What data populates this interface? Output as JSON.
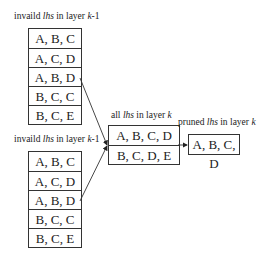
{
  "top_group": {
    "label_pre": "invaild ",
    "label_em": "lhs",
    "label_mid": " in layer ",
    "label_k": "k",
    "label_post": "-1",
    "rows": [
      "A, B, C",
      "A, C, D",
      "A, B, D",
      "B, C, C",
      "B, C, E"
    ]
  },
  "bottom_group": {
    "label_pre": "invaild ",
    "label_em": "lhs",
    "label_mid": " in layer ",
    "label_k": "k",
    "label_post": "-1",
    "rows": [
      "A, B, C",
      "A, C, D",
      "A, B, D",
      "B, C, C",
      "B, C, E"
    ]
  },
  "middle_group": {
    "label_pre": "all ",
    "label_em": "lhs",
    "label_mid": " in layer ",
    "label_k": "k",
    "rows": [
      "A, B, C, D",
      "B, C, D, E"
    ]
  },
  "right_group": {
    "label_pre": "pruned ",
    "label_em": "lhs",
    "label_mid": " in layer ",
    "label_k": "k",
    "rows": [
      "A, B, C, D"
    ]
  }
}
